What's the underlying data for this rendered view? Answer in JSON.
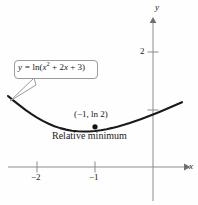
{
  "figure": {
    "background_color": "#fefefe",
    "curve_color": "#1a1a1a",
    "axis_color": "#8c8c8c",
    "text_color": "#1a1a1a",
    "callout_border_color": "#9a9a9a"
  },
  "axes": {
    "x_axis_label": "x",
    "y_axis_label": "y",
    "x_ticks": [
      {
        "label": "−2",
        "value": -2
      },
      {
        "label": "−1",
        "value": -1
      }
    ],
    "y_ticks": [
      {
        "label": "2",
        "value": 2
      },
      {
        "label": "",
        "value": 1
      }
    ]
  },
  "callout": {
    "equation_lead": "y = ",
    "equation_fn": "ln(",
    "equation_var1": "x",
    "equation_exp": "2",
    "equation_mid": " + 2",
    "equation_var2": "x",
    "equation_tail": " + 3)",
    "equation_plain": "y = ln(x² + 2x + 3)"
  },
  "annotations": {
    "point_label": "(−1, ln 2)",
    "relative_minimum_label": "Relative minimum"
  },
  "chart_data": {
    "type": "line",
    "title": "",
    "xlabel": "x",
    "ylabel": "y",
    "function": "y = ln(x^2 + 2x + 3)",
    "xlim": [
      -2.5,
      0.55
    ],
    "ylim": [
      -0.35,
      2.7
    ],
    "grid": false,
    "legend": "none",
    "xticks": [
      -2,
      -1
    ],
    "xtick_labels": [
      "−2",
      "−1"
    ],
    "yticks": [
      1,
      2
    ],
    "ytick_labels": [
      "",
      "2"
    ],
    "annotations": [
      {
        "text": "(−1, ln 2)",
        "x": -1,
        "y": 0.693,
        "type": "point-label"
      },
      {
        "text": "Relative minimum",
        "x": -1,
        "y": 0.693,
        "type": "caption"
      },
      {
        "text": "y = ln(x² + 2x + 3)",
        "type": "callout-box"
      }
    ],
    "marked_points": [
      {
        "x": -1,
        "y": 0.693,
        "label": "(−1, ln 2)"
      }
    ],
    "x": [
      -2.5,
      -2.4,
      -2.3,
      -2.2,
      -2.1,
      -2.0,
      -1.9,
      -1.8,
      -1.7,
      -1.6,
      -1.5,
      -1.4,
      -1.3,
      -1.2,
      -1.1,
      -1.0,
      -0.9,
      -0.8,
      -0.7,
      -0.6,
      -0.5,
      -0.4,
      -0.3,
      -0.2,
      -0.1,
      0.0,
      0.1,
      0.2,
      0.3,
      0.4,
      0.5
    ],
    "y": [
      1.2238,
      1.141,
      1.0613,
      0.9858,
      0.9156,
      0.8518,
      0.7949,
      0.7455,
      0.7039,
      0.6702,
      0.6444,
      0.6262,
      0.6152,
      0.6111,
      0.6133,
      0.6213,
      0.6345,
      0.6523,
      0.6742,
      0.6997,
      0.7282,
      0.7594,
      0.7929,
      0.8285,
      0.8659,
      0.9048,
      0.9452,
      0.9867,
      1.0293,
      1.0728,
      1.117
    ]
  }
}
